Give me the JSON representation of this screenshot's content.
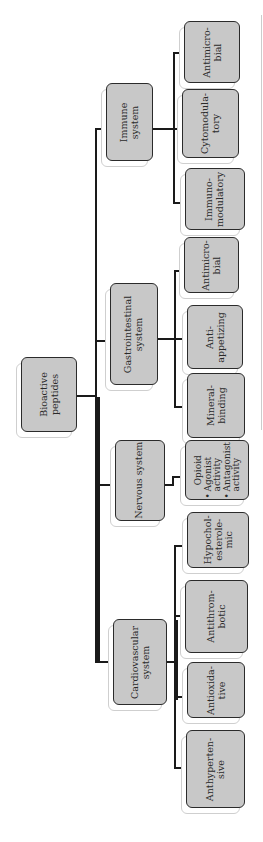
{
  "diagram": {
    "root": {
      "lines": [
        "Bioactive",
        "peptides"
      ]
    },
    "categories": [
      {
        "id": "immune",
        "lines": [
          "Immune",
          "system"
        ],
        "children": [
          {
            "lines": [
              "Antimicro-",
              "bial"
            ]
          },
          {
            "lines": [
              "Cytomodula-",
              "tory"
            ]
          },
          {
            "lines": [
              "Immuno-",
              "modulatory"
            ]
          }
        ]
      },
      {
        "id": "gastrointestinal",
        "lines": [
          "Gastrointestinal",
          "system"
        ],
        "children": [
          {
            "lines": [
              "Antimicro-",
              "bial"
            ]
          },
          {
            "lines": [
              "Anti-",
              "appetizing"
            ]
          },
          {
            "lines": [
              "Mineral-",
              "binding"
            ]
          }
        ]
      },
      {
        "id": "nervous",
        "lines": [
          "Nervous system"
        ],
        "children": [
          {
            "title": "Opioid",
            "bullets": [
              [
                "Agonist",
                "activity"
              ],
              [
                "Antagonist",
                "activity"
              ]
            ]
          }
        ]
      },
      {
        "id": "cardiovascular",
        "lines": [
          "Cardiovascular",
          "system"
        ],
        "children": [
          {
            "lines": [
              "Hypochol-",
              "esterole-",
              "mic"
            ]
          },
          {
            "lines": [
              "Antithrom-",
              "botic"
            ]
          },
          {
            "lines": [
              "Antioxida-",
              "tive"
            ]
          },
          {
            "lines": [
              "Anthyperten-",
              "sive"
            ]
          }
        ]
      }
    ]
  },
  "colors": {
    "box_fill": "#c8c8c8",
    "box_border": "#2b2b2b",
    "line": "#1a1a1a",
    "shadow_border": "#cfcfcf"
  }
}
